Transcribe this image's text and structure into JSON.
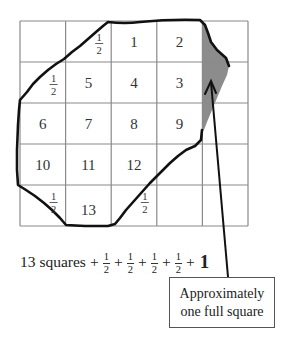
{
  "diagram": {
    "grid": {
      "rows": 5,
      "columns": 5
    },
    "cells": [
      {
        "row": 0,
        "col": 2,
        "label": "1"
      },
      {
        "row": 0,
        "col": 3,
        "label": "2"
      },
      {
        "row": 1,
        "col": 3,
        "label": "3"
      },
      {
        "row": 1,
        "col": 2,
        "label": "4"
      },
      {
        "row": 1,
        "col": 1,
        "label": "5"
      },
      {
        "row": 2,
        "col": 0,
        "label": "6"
      },
      {
        "row": 2,
        "col": 1,
        "label": "7"
      },
      {
        "row": 2,
        "col": 2,
        "label": "8"
      },
      {
        "row": 2,
        "col": 3,
        "label": "9"
      },
      {
        "row": 3,
        "col": 0,
        "label": "10"
      },
      {
        "row": 3,
        "col": 1,
        "label": "11"
      },
      {
        "row": 3,
        "col": 2,
        "label": "12"
      },
      {
        "row": 4,
        "col": 1,
        "label": "13"
      }
    ],
    "half_cells": [
      {
        "row": 0,
        "col": 1,
        "numerator": "1",
        "denominator": "2"
      },
      {
        "row": 1,
        "col": 0,
        "numerator": "1",
        "denominator": "2"
      },
      {
        "row": 4,
        "col": 0,
        "numerator": "1",
        "denominator": "2"
      },
      {
        "row": 4,
        "col": 2,
        "numerator": "1",
        "denominator": "2"
      }
    ],
    "shaded_region": {
      "description": "Shaded partial region along right edge",
      "color": "#8c8c8c"
    },
    "outline_color": "#111111",
    "grid_color": "#8a8a8a"
  },
  "equation": {
    "lead": "13 squares",
    "plus": "+",
    "fractions": [
      {
        "numerator": "1",
        "denominator": "2"
      },
      {
        "numerator": "1",
        "denominator": "2"
      },
      {
        "numerator": "1",
        "denominator": "2"
      },
      {
        "numerator": "1",
        "denominator": "2"
      }
    ],
    "total_addend": "1"
  },
  "callout": {
    "line1": "Approximately",
    "line2": "one full square"
  }
}
